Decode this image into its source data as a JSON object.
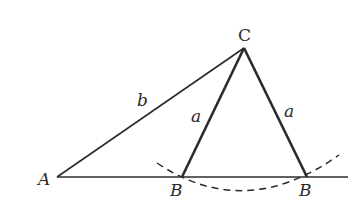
{
  "diagram": {
    "colors": {
      "stroke": "#2b2b2b",
      "background": "#ffffff"
    },
    "points": {
      "A": {
        "label": "A",
        "x": 57,
        "y": 177
      },
      "C": {
        "label": "C",
        "x": 244,
        "y": 48
      },
      "B1": {
        "label": "B",
        "x": 182,
        "y": 177
      },
      "B2": {
        "label": "B",
        "x": 307,
        "y": 177
      }
    },
    "sides": {
      "b": {
        "label": "b",
        "from": "A",
        "to": "C"
      },
      "a_left": {
        "label": "a",
        "from": "C",
        "to": "B1"
      },
      "a_right": {
        "label": "a",
        "from": "C",
        "to": "B2"
      }
    },
    "baseline": {
      "from": "A",
      "to_x": 348
    },
    "arc": {
      "style": "dashed",
      "center": "C",
      "radius_label": "a"
    }
  }
}
